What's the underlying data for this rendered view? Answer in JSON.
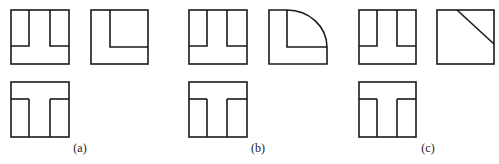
{
  "figures": [
    {
      "label": "(a)",
      "label_x": 80,
      "side_view": "L-shape with inner corner lines"
    },
    {
      "label": "(b)",
      "label_x": 258,
      "side_view": "L-shape with quarter-circle arc"
    },
    {
      "label": "(c)",
      "label_x": 428,
      "side_view": "square with diagonal cut line"
    }
  ],
  "colors": {
    "stroke": "#1a1a1a",
    "background": "#ffffff"
  }
}
